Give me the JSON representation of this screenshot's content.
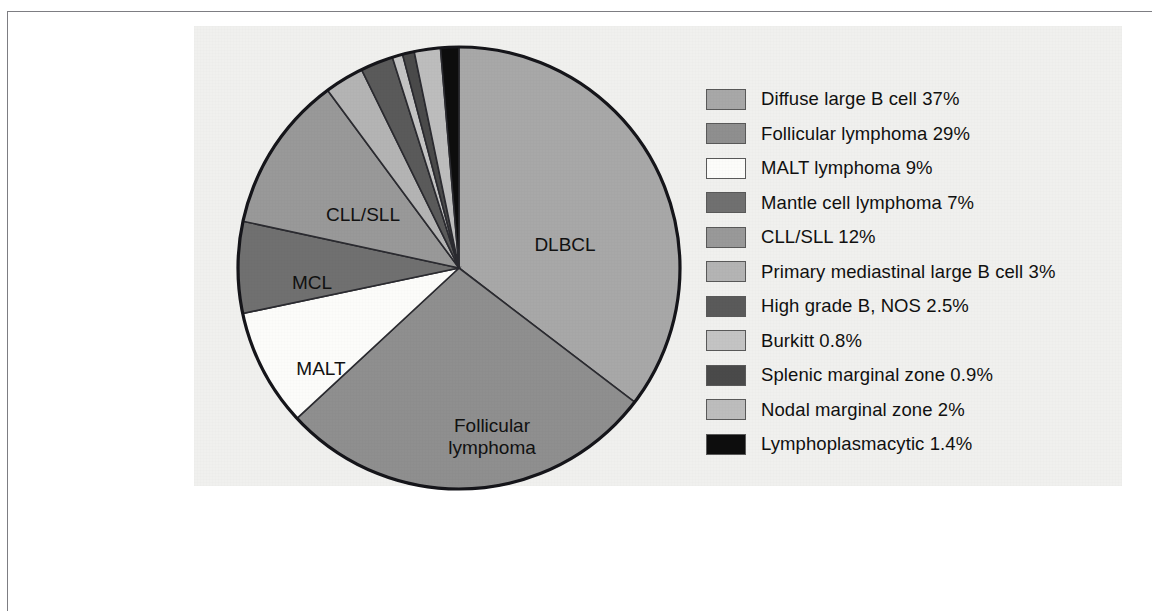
{
  "figure": {
    "background_color": "#f0f0ee",
    "frame_color": "#7d7d82"
  },
  "chart_data": {
    "type": "pie",
    "title": "",
    "legend_position": "right",
    "start_angle_deg": 0,
    "direction": "clockwise",
    "categories": [
      "Diffuse large B cell",
      "Follicular lymphoma",
      "MALT lymphoma",
      "Mantle cell lymphoma",
      "CLL/SLL",
      "Primary mediastinal large B cell",
      "High grade B, NOS",
      "Burkitt",
      "Splenic marginal zone",
      "Nodal marginal zone",
      "Lymphoplasmacytic"
    ],
    "values": [
      37,
      29,
      9,
      7,
      12,
      3,
      2.5,
      0.8,
      0.9,
      2,
      1.4
    ],
    "value_labels": [
      "37%",
      "29%",
      "9%",
      "7%",
      "12%",
      "3%",
      "2.5%",
      "0.8%",
      "0.9%",
      "2%",
      "1.4%"
    ],
    "colors": [
      "#a8a8a8",
      "#8f8f8f",
      "#fcfcfa",
      "#707070",
      "#999999",
      "#b4b4b4",
      "#5a5a5a",
      "#c4c4c4",
      "#4a4a4a",
      "#bdbdbd",
      "#0d0d0d"
    ],
    "slices": [
      {
        "key": "dlbcl",
        "legend_label": "Diffuse large B cell 37%",
        "name": "Diffuse large B cell",
        "value": 37,
        "value_label": "37%",
        "color": "#a8a8a8",
        "pie_label": "DLBCL"
      },
      {
        "key": "follicular",
        "legend_label": "Follicular lymphoma 29%",
        "name": "Follicular lymphoma",
        "value": 29,
        "value_label": "29%",
        "color": "#8f8f8f",
        "pie_label": "Follicular lymphoma"
      },
      {
        "key": "malt",
        "legend_label": "MALT lymphoma 9%",
        "name": "MALT lymphoma",
        "value": 9,
        "value_label": "9%",
        "color": "#fcfcfa",
        "pie_label": "MALT"
      },
      {
        "key": "mcl",
        "legend_label": "Mantle cell lymphoma 7%",
        "name": "Mantle cell lymphoma",
        "value": 7,
        "value_label": "7%",
        "color": "#707070",
        "pie_label": "MCL"
      },
      {
        "key": "cll-sll",
        "legend_label": "CLL/SLL 12%",
        "name": "CLL/SLL",
        "value": 12,
        "value_label": "12%",
        "color": "#999999",
        "pie_label": "CLL/SLL"
      },
      {
        "key": "pmblc",
        "legend_label": "Primary mediastinal large B cell 3%",
        "name": "Primary mediastinal large B cell",
        "value": 3,
        "value_label": "3%",
        "color": "#b4b4b4",
        "pie_label": ""
      },
      {
        "key": "high-grade-b",
        "legend_label": "High grade B, NOS 2.5%",
        "name": "High grade B, NOS",
        "value": 2.5,
        "value_label": "2.5%",
        "color": "#5a5a5a",
        "pie_label": ""
      },
      {
        "key": "burkitt",
        "legend_label": "Burkitt 0.8%",
        "name": "Burkitt",
        "value": 0.8,
        "value_label": "0.8%",
        "color": "#c4c4c4",
        "pie_label": ""
      },
      {
        "key": "splenic-mz",
        "legend_label": "Splenic marginal zone 0.9%",
        "name": "Splenic marginal zone",
        "value": 0.9,
        "value_label": "0.9%",
        "color": "#4a4a4a",
        "pie_label": ""
      },
      {
        "key": "nodal-mz",
        "legend_label": "Nodal marginal zone 2%",
        "name": "Nodal marginal zone",
        "value": 2,
        "value_label": "2%",
        "color": "#bdbdbd",
        "pie_label": ""
      },
      {
        "key": "lpl",
        "legend_label": "Lymphoplasmacytic 1.4%",
        "name": "Lymphoplasmacytic",
        "value": 1.4,
        "value_label": "1.4%",
        "color": "#0d0d0d",
        "pie_label": ""
      }
    ],
    "pie_labels": [
      {
        "text": "DLBCL",
        "x": 330,
        "y": 202
      },
      {
        "text": "Follicular",
        "x": 257,
        "y": 383
      },
      {
        "text": "lymphoma",
        "x": 257,
        "y": 405
      },
      {
        "text": "MALT",
        "x": 86,
        "y": 326
      },
      {
        "text": "MCL",
        "x": 77,
        "y": 240
      },
      {
        "text": "CLL/SLL",
        "x": 128,
        "y": 172
      }
    ]
  }
}
